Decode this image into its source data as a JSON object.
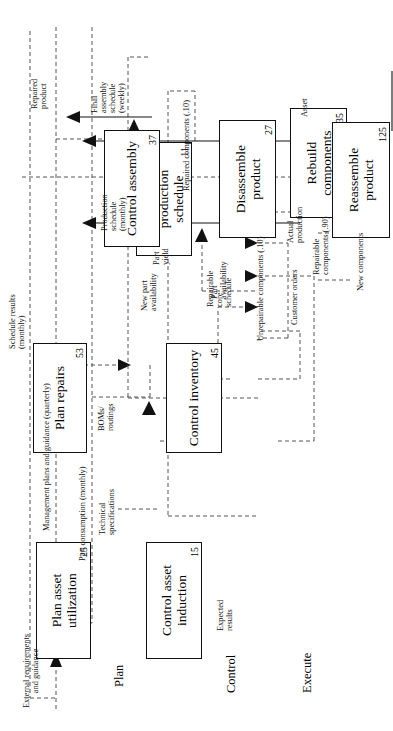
{
  "diagram": {
    "orientation": "rotated-90-ccw",
    "phases": [
      {
        "id": "plan",
        "label": "Plan"
      },
      {
        "id": "control",
        "label": "Control"
      },
      {
        "id": "execute",
        "label": "Execute"
      }
    ],
    "boxes": [
      {
        "id": "plan-asset-utilization",
        "title": "Plan asset\nutilization",
        "num": "25"
      },
      {
        "id": "plan-repairs",
        "title": "Plan\nrepairs",
        "num": "53"
      },
      {
        "id": "develop-master-production-schedule",
        "title": "Develop master\nproduction\nschedule",
        "num": "11"
      },
      {
        "id": "control-asset-induction",
        "title": "Control asset\ninduction",
        "num": "15"
      },
      {
        "id": "control-inventory",
        "title": "Control\ninventory",
        "num": "45"
      },
      {
        "id": "control-assembly",
        "title": "Control\nassembly",
        "num": "37"
      },
      {
        "id": "disassemble-product",
        "title": "Disassemble\nproduct",
        "num": "27"
      },
      {
        "id": "rebuild-components",
        "title": "Rebuild\ncomponents",
        "num": "235"
      },
      {
        "id": "reassemble-product",
        "title": "Reassemble\nproduct",
        "num": "125"
      }
    ],
    "flow_labels": [
      {
        "id": "external-requirements-and-guidance",
        "text": "External requirements\nand guidance"
      },
      {
        "id": "management-plans-and-guidance",
        "text": "Management plans and guidance (quarterly)"
      },
      {
        "id": "part-consumption",
        "text": "Part consumption (monthly)"
      },
      {
        "id": "schedule-results",
        "text": "Schedule results\n(monthly)"
      },
      {
        "id": "production-schedule",
        "text": "Production\nschedule\n(monthly)"
      },
      {
        "id": "final-assembly-schedule",
        "text": "Final\nassembly\nschedule\n(weekly)"
      },
      {
        "id": "repaired-product",
        "text": "Repaired\nproduct"
      },
      {
        "id": "boms-routings",
        "text": "BOMs/\nroutings"
      },
      {
        "id": "customer-orders",
        "text": "Customer orders"
      },
      {
        "id": "part-availability",
        "text": "Part\navailability"
      },
      {
        "id": "actual-production",
        "text": "Actual\nproduction"
      },
      {
        "id": "repaired-components",
        "text": "Repaired components (.10)"
      },
      {
        "id": "technical-specifications",
        "text": "Technical\nspecifications"
      },
      {
        "id": "new-part-availability",
        "text": "New part\navailability"
      },
      {
        "id": "part-yield",
        "text": "Part\nyield"
      },
      {
        "id": "unrepairable-components",
        "text": "Unrepairable components (.10)"
      },
      {
        "id": "expected-results",
        "text": "Expected\nresults"
      },
      {
        "id": "repairable-core-schedule",
        "text": "Repairable\ncore\nschedule"
      },
      {
        "id": "repairable-components",
        "text": "Repairable\ncomponents (.90)"
      },
      {
        "id": "new-components",
        "text": "New components"
      },
      {
        "id": "asset",
        "text": "Asset"
      }
    ],
    "colors": {
      "line": "#111111",
      "dashed_line": "#555555",
      "background": "#ffffff"
    }
  }
}
